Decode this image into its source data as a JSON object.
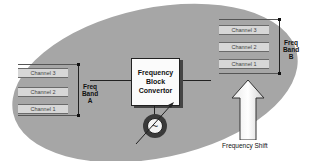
{
  "diagram": {
    "band_a": {
      "label_lines": [
        "Freq",
        "Band",
        "A"
      ],
      "channels": [
        "Channel 3",
        "Channel 2",
        "Channel 1"
      ]
    },
    "band_b": {
      "label_lines": [
        "Freq",
        "Band",
        "B"
      ],
      "channels": [
        "Channel 3",
        "Channel 2",
        "Channel 1"
      ]
    },
    "converter": {
      "label_lines": [
        "Frequency",
        "Block",
        "Convertor"
      ]
    },
    "oscillator": {
      "symbol": "~"
    },
    "shift_arrow": {
      "label": "Frequency Shift"
    },
    "colors": {
      "background": "#ffffff",
      "ellipse": "#a6a6a6",
      "channel_bar": "#d7d7d7",
      "block": "#fbfbfb"
    }
  }
}
